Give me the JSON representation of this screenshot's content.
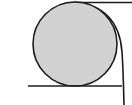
{
  "figure": {
    "type": "geometric-diagram",
    "canvas": {
      "width": 132,
      "height": 105,
      "background_color": "#ffffff"
    },
    "colors": {
      "stroke": "#1c1c1c",
      "circle_fill": "#d2d2d2",
      "background": "#ffffff"
    },
    "stroke_width": 1.6,
    "elements": {
      "circle": {
        "name": "shaded-circle",
        "center_x": 75,
        "center_y": 44,
        "radius": 42,
        "fill": "#d2d2d2",
        "stroke": "#1c1c1c"
      },
      "top_line": {
        "name": "top-horizontal-line",
        "x1": 75,
        "y1": 2.5,
        "x2": 132,
        "y2": 2.5
      },
      "bottom_line": {
        "name": "bottom-horizontal-line",
        "x1": 28,
        "y1": 86,
        "x2": 122,
        "y2": 86
      },
      "arc": {
        "name": "large-sweeping-arc",
        "start_x": 75,
        "start_y": 2.5,
        "control_x": 120,
        "control_y": 42,
        "end_x": 124,
        "end_y": 105,
        "description": "Arc sweeping from the top tangency point rightwards and downwards past the bottom line to the lower edge"
      }
    }
  }
}
